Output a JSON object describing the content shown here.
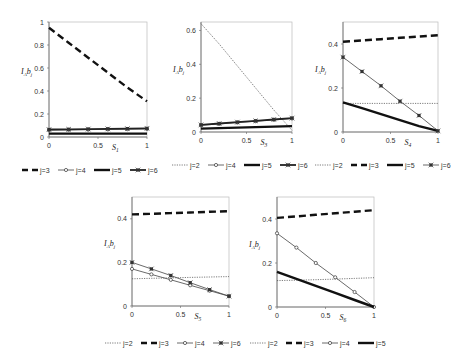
{
  "chart_data": [
    {
      "type": "line",
      "box": {
        "x0": 49,
        "x1": 147,
        "y0": 22,
        "y1": 137
      },
      "ylim": [
        0,
        1
      ],
      "yticks": [
        0,
        0.2,
        0.4,
        0.6,
        0.8,
        1
      ],
      "ytick_labels": [
        "0",
        "0.2",
        "0.4",
        "0.6",
        "0.8",
        "1"
      ],
      "xticks": [
        0,
        0.5,
        1
      ],
      "xtick_labels": [
        "0",
        "0.5",
        "1"
      ],
      "xlabel": "S1",
      "xlabel_main": "S",
      "xlabel_sub": "1",
      "ylabel": "IAbj",
      "x": [
        0,
        0.2,
        0.4,
        0.6,
        0.8,
        1
      ],
      "series": [
        {
          "name": "j=3",
          "style": "dash",
          "values": [
            0.95,
            0.82,
            0.69,
            0.56,
            0.43,
            0.31
          ]
        },
        {
          "name": "j=4",
          "style": "thin-circle",
          "values": [
            0.06,
            0.062,
            0.064,
            0.066,
            0.068,
            0.07
          ]
        },
        {
          "name": "j=5",
          "style": "thick",
          "values": [
            0.03,
            0.03,
            0.03,
            0.03,
            0.03,
            0.03
          ]
        },
        {
          "name": "j=6",
          "style": "thick-star",
          "values": [
            0.065,
            0.067,
            0.069,
            0.071,
            0.073,
            0.075
          ]
        }
      ],
      "legend": {
        "y": 170,
        "x": 22,
        "entries": [
          "j=3",
          "j=4",
          "j=5",
          "j=6"
        ]
      }
    },
    {
      "type": "line",
      "box": {
        "x0": 201,
        "x1": 292,
        "y0": 22,
        "y1": 132
      },
      "ylim": [
        0,
        0.65
      ],
      "yticks": [
        0,
        0.2,
        0.4,
        0.6
      ],
      "ytick_labels": [
        "0",
        "0.2",
        "0.4",
        "0.6"
      ],
      "xticks": [
        0,
        0.5,
        1
      ],
      "xtick_labels": [
        "0",
        "0.5",
        "1"
      ],
      "xlabel": "S3",
      "xlabel_main": "S",
      "xlabel_sub": "3",
      "ylabel": "IAbj",
      "x": [
        0,
        0.2,
        0.4,
        0.6,
        0.8,
        1
      ],
      "series": [
        {
          "name": "j=2",
          "style": "dot",
          "values": [
            0.64,
            0.52,
            0.39,
            0.26,
            0.13,
            0.01
          ]
        },
        {
          "name": "j=4",
          "style": "thin-circle",
          "values": [
            0.04,
            0.048,
            0.056,
            0.064,
            0.072,
            0.08
          ]
        },
        {
          "name": "j=5",
          "style": "thick",
          "values": [
            0.02,
            0.023,
            0.026,
            0.029,
            0.032,
            0.035
          ]
        },
        {
          "name": "j=6",
          "style": "thick-star",
          "values": [
            0.042,
            0.05,
            0.058,
            0.066,
            0.074,
            0.082
          ]
        }
      ],
      "legend": {
        "y": 165,
        "x": 172,
        "entries": [
          "j=2",
          "j=4",
          "j=5",
          "j=6"
        ]
      }
    },
    {
      "type": "line",
      "box": {
        "x0": 343,
        "x1": 438,
        "y0": 22,
        "y1": 132
      },
      "ylim": [
        0,
        0.5
      ],
      "yticks": [
        0,
        0.2,
        0.4
      ],
      "ytick_labels": [
        "0",
        "0.2",
        "0.4"
      ],
      "xticks": [
        0,
        0.5,
        1
      ],
      "xtick_labels": [
        "0",
        "0.5",
        "1"
      ],
      "xlabel": "S4",
      "xlabel_main": "S",
      "xlabel_sub": "4",
      "ylabel": "IAbj",
      "x": [
        0,
        0.2,
        0.4,
        0.6,
        0.8,
        1
      ],
      "series": [
        {
          "name": "j=2",
          "style": "dot",
          "values": [
            0.13,
            0.13,
            0.13,
            0.13,
            0.13,
            0.13
          ]
        },
        {
          "name": "j=3",
          "style": "dash",
          "values": [
            0.41,
            0.416,
            0.422,
            0.428,
            0.434,
            0.44
          ]
        },
        {
          "name": "j=5",
          "style": "thick",
          "values": [
            0.135,
            0.108,
            0.081,
            0.054,
            0.027,
            0.005
          ]
        },
        {
          "name": "j=6",
          "style": "thin-star",
          "values": [
            0.34,
            0.275,
            0.21,
            0.14,
            0.075,
            0.005
          ]
        }
      ],
      "legend": {
        "y": 165,
        "x": 315,
        "entries": [
          "j=2",
          "j=3",
          "j=5",
          "j=6"
        ]
      }
    },
    {
      "type": "line",
      "box": {
        "x0": 132,
        "x1": 229,
        "y0": 197,
        "y1": 306
      },
      "ylim": [
        0,
        0.5
      ],
      "yticks": [
        0,
        0.2,
        0.4
      ],
      "ytick_labels": [
        "0",
        "0.2",
        "0.4"
      ],
      "xticks": [
        0,
        0.5,
        1
      ],
      "xtick_labels": [
        "0",
        "0.5",
        "1"
      ],
      "xlabel": "S5",
      "xlabel_main": "S",
      "xlabel_sub": "5",
      "ylabel": "IAbj",
      "x": [
        0,
        0.2,
        0.4,
        0.6,
        0.8,
        1
      ],
      "series": [
        {
          "name": "j=2",
          "style": "dot",
          "values": [
            0.125,
            0.127,
            0.129,
            0.131,
            0.133,
            0.135
          ]
        },
        {
          "name": "j=3",
          "style": "dash",
          "values": [
            0.42,
            0.423,
            0.426,
            0.429,
            0.432,
            0.435
          ]
        },
        {
          "name": "j=4",
          "style": "thin-circle",
          "values": [
            0.17,
            0.145,
            0.12,
            0.095,
            0.07,
            0.045
          ]
        },
        {
          "name": "j=6",
          "style": "thin-star",
          "values": [
            0.2,
            0.17,
            0.14,
            0.107,
            0.075,
            0.045
          ]
        }
      ],
      "legend": {
        "y": 343,
        "x": 105,
        "entries": [
          "j=2",
          "j=3",
          "j=4",
          "j=6"
        ]
      }
    },
    {
      "type": "line",
      "box": {
        "x0": 277,
        "x1": 374,
        "y0": 197,
        "y1": 307
      },
      "ylim": [
        0,
        0.5
      ],
      "yticks": [
        0,
        0.2,
        0.4
      ],
      "ytick_labels": [
        "0",
        "0.2",
        "0.4"
      ],
      "xticks": [
        0,
        0.5,
        1
      ],
      "xtick_labels": [
        "0",
        "0.5",
        "1"
      ],
      "xlabel": "S6",
      "xlabel_main": "S",
      "xlabel_sub": "6",
      "ylabel": "IAbj",
      "x": [
        0,
        0.2,
        0.4,
        0.6,
        0.8,
        1
      ],
      "series": [
        {
          "name": "j=2",
          "style": "dot",
          "values": [
            0.12,
            0.122,
            0.124,
            0.127,
            0.13,
            0.133
          ]
        },
        {
          "name": "j=3",
          "style": "dash",
          "values": [
            0.405,
            0.412,
            0.419,
            0.426,
            0.433,
            0.44
          ]
        },
        {
          "name": "j=4",
          "style": "thin-circle",
          "values": [
            0.335,
            0.27,
            0.2,
            0.135,
            0.068,
            0.0
          ]
        },
        {
          "name": "j=5",
          "style": "thick",
          "values": [
            0.16,
            0.128,
            0.096,
            0.064,
            0.032,
            0.0
          ]
        }
      ],
      "legend": {
        "y": 343,
        "x": 250,
        "entries": [
          "j=2",
          "j=3",
          "j=4",
          "j=5"
        ]
      }
    }
  ]
}
